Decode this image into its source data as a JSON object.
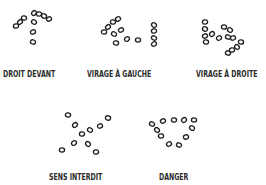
{
  "signs": [
    {
      "label": "DROIT DEVANT",
      "meaning": "go straight ahead",
      "pebbles": [
        [
          34,
          13
        ],
        [
          39,
          14
        ],
        [
          44,
          16
        ],
        [
          49,
          19
        ],
        [
          24,
          18
        ],
        [
          20,
          22
        ],
        [
          16,
          26
        ],
        [
          34,
          22
        ],
        [
          33,
          32
        ],
        [
          33,
          42
        ]
      ]
    },
    {
      "label": "VIRAGE À GAUCHE",
      "meaning": "turn left",
      "pebbles": [
        [
          118,
          19
        ],
        [
          113,
          22
        ],
        [
          108,
          27
        ],
        [
          104,
          32
        ],
        [
          114,
          34
        ],
        [
          121,
          30
        ],
        [
          116,
          43
        ],
        [
          127,
          39
        ],
        [
          138,
          40
        ],
        [
          154,
          25
        ],
        [
          154,
          31
        ],
        [
          154,
          38
        ],
        [
          154,
          44
        ]
      ]
    },
    {
      "label": "VIRAGE À DROITE",
      "meaning": "turn right",
      "pebbles": [
        [
          205,
          22
        ],
        [
          205,
          29
        ],
        [
          205,
          36
        ],
        [
          206,
          42
        ],
        [
          212,
          34
        ],
        [
          224,
          27
        ],
        [
          230,
          30
        ],
        [
          233,
          38
        ],
        [
          228,
          37
        ],
        [
          219,
          38
        ],
        [
          241,
          42
        ],
        [
          237,
          47
        ],
        [
          232,
          50
        ],
        [
          228,
          53
        ]
      ]
    },
    {
      "label": "SENS INTERDIT",
      "meaning": "no entry",
      "pebbles": [
        [
          68,
          115
        ],
        [
          75,
          125
        ],
        [
          82,
          134
        ],
        [
          90,
          130
        ],
        [
          100,
          126
        ],
        [
          108,
          118
        ],
        [
          74,
          143
        ],
        [
          62,
          150
        ],
        [
          88,
          144
        ],
        [
          96,
          152
        ]
      ]
    },
    {
      "label": "DANGER",
      "meaning": "danger",
      "pebbles": [
        [
          152,
          124
        ],
        [
          163,
          121
        ],
        [
          174,
          120
        ],
        [
          184,
          120
        ],
        [
          194,
          120
        ],
        [
          192,
          128
        ],
        [
          186,
          137
        ],
        [
          179,
          145
        ],
        [
          169,
          144
        ],
        [
          161,
          136
        ],
        [
          157,
          130
        ]
      ]
    }
  ],
  "labels_layout": [
    {
      "x": 3,
      "y": 70
    },
    {
      "x": 87,
      "y": 70
    },
    {
      "x": 196,
      "y": 70
    },
    {
      "x": 49,
      "y": 173
    },
    {
      "x": 159,
      "y": 173
    }
  ]
}
